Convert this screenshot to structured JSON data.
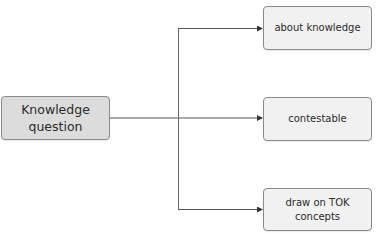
{
  "diagram": {
    "source": {
      "label_line1": "Knowledge",
      "label_line2": "question"
    },
    "targets": [
      {
        "label_line1": "about knowledge",
        "label_line2": ""
      },
      {
        "label_line1": "contestable",
        "label_line2": ""
      },
      {
        "label_line1": "draw on TOK",
        "label_line2": "concepts"
      }
    ],
    "colors": {
      "source_fill": "#dcdcdc",
      "target_fill": "#f1f1f1",
      "border": "#8a8a8a",
      "line": "#555555"
    }
  }
}
